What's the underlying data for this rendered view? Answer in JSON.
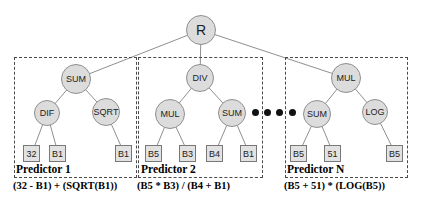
{
  "tree": {
    "root_label": "R"
  },
  "predictors": [
    {
      "name": "Predictor 1",
      "formula": "(32 - B1) + (SQRT(B1))",
      "ops": {
        "top": "SUM",
        "left": "DIF",
        "right": "SQRT"
      },
      "leaves": [
        "32",
        "B1",
        "B1"
      ]
    },
    {
      "name": "Predictor 2",
      "formula": "(B5 * B3) / (B4 + B1)",
      "ops": {
        "top": "DIV",
        "left": "MUL",
        "right": "SUM"
      },
      "leaves": [
        "B5",
        "B3",
        "B4",
        "B1"
      ]
    },
    {
      "name": "Predictor N",
      "formula": "(B5 + 51) * (LOG(B5))",
      "ops": {
        "top": "MUL",
        "left": "SUM",
        "right": "LOG"
      },
      "leaves": [
        "B5",
        "51",
        "B5"
      ]
    }
  ],
  "colors": {
    "node_fill": "#dcdcdc",
    "node_border": "#8f8f8f",
    "leaf_fill": "#e2e2e2",
    "edge": "#8f8f8f",
    "box_dash": "#4a4a4a"
  }
}
